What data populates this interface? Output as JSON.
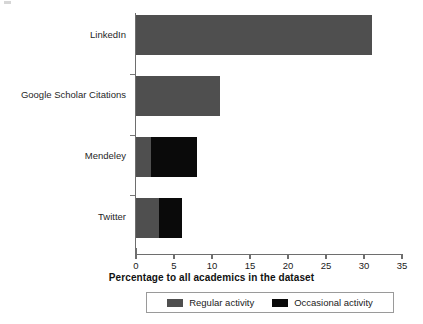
{
  "chart_data": {
    "type": "bar",
    "orientation": "horizontal",
    "stacked": true,
    "title": "",
    "xlabel": "Percentage to all academics in the dataset",
    "ylabel": "",
    "xlim": [
      0,
      35
    ],
    "xticks": [
      0,
      5,
      10,
      15,
      20,
      25,
      30,
      35
    ],
    "xtick_labels": [
      "0",
      "5",
      "10",
      "15",
      "20",
      "25",
      "30",
      "35"
    ],
    "grid": false,
    "legend_position": "bottom",
    "categories": [
      "LinkedIn",
      "Google Scholar Citations",
      "Mendeley",
      "Twitter"
    ],
    "series": [
      {
        "name": "Regular activity",
        "color": "#4f4f4f",
        "values": [
          31,
          11,
          2,
          3
        ]
      },
      {
        "name": "Occasional activity",
        "color": "#0a0a0a",
        "values": [
          0,
          0,
          6,
          3
        ]
      }
    ],
    "totals": [
      31,
      11,
      8,
      6
    ]
  },
  "legend": {
    "items": [
      {
        "label": "Regular activity",
        "color": "#4f4f4f"
      },
      {
        "label": "Occasional activity",
        "color": "#0a0a0a"
      }
    ]
  }
}
